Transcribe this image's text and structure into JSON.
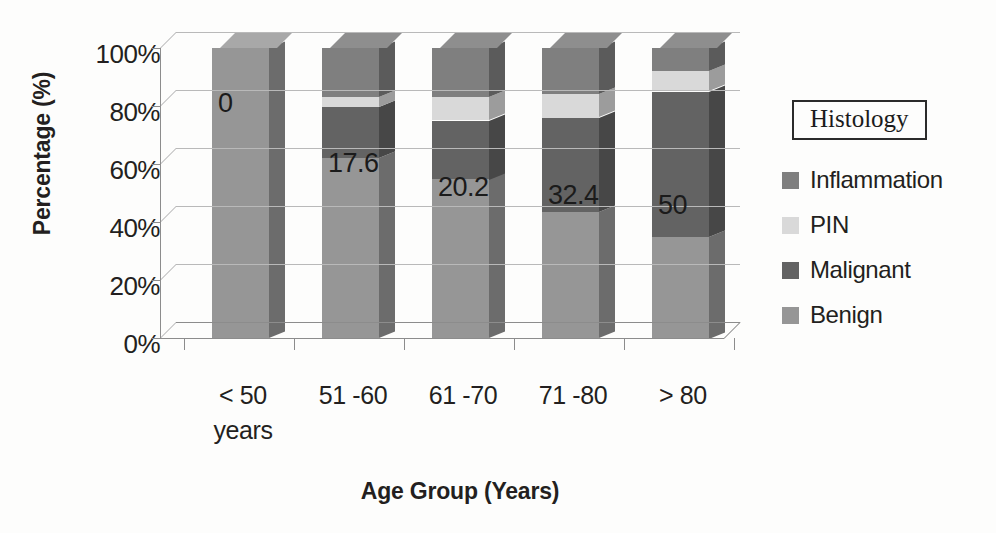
{
  "chart_data": {
    "type": "bar",
    "subtype": "stacked-column-100-3d",
    "title": "",
    "xlabel": "Age Group (Years)",
    "ylabel": "Percentage (%)",
    "ylim": [
      0,
      100
    ],
    "ytick_labels": [
      "0%",
      "20%",
      "40%",
      "60%",
      "80%",
      "100%"
    ],
    "ytick_values": [
      0,
      20,
      40,
      60,
      80,
      100
    ],
    "grid": true,
    "legend_position": "right",
    "legend_title": "Histology",
    "categories": [
      "< 50\nyears",
      "51 -60",
      "61 -70",
      "71 -80",
      "> 80"
    ],
    "categories_flat": [
      "< 50 years",
      "51 -60",
      "61 -70",
      "71 -80",
      "> 80"
    ],
    "series": [
      {
        "name": "Benign",
        "color": "#969696",
        "values": [
          100.0,
          62.0,
          54.8,
          43.6,
          35.0
        ]
      },
      {
        "name": "Malignant",
        "color": "#636363",
        "values": [
          0.0,
          17.6,
          20.2,
          32.4,
          50.0
        ]
      },
      {
        "name": "PIN",
        "color": "#d9d9d9",
        "values": [
          0.0,
          3.4,
          8.0,
          8.0,
          7.0
        ]
      },
      {
        "name": "Inflammation",
        "color": "#7f7f7f",
        "values": [
          0.0,
          17.0,
          17.0,
          16.0,
          8.0
        ]
      }
    ],
    "data_labels": [
      "0",
      "17.6",
      "20.2",
      "32.4",
      "50"
    ],
    "data_labels_series": "Malignant"
  },
  "legend": {
    "title": "Histology",
    "items": [
      {
        "label": "Inflammation",
        "color": "#7f7f7f"
      },
      {
        "label": "PIN",
        "color": "#d9d9d9"
      },
      {
        "label": "Malignant",
        "color": "#636363"
      },
      {
        "label": "Benign",
        "color": "#969696"
      }
    ]
  },
  "axes": {
    "y_title": "Percentage (%)",
    "x_title": "Age Group (Years)",
    "y_ticks": [
      "100%",
      "80%",
      "60%",
      "40%",
      "20%",
      "0%"
    ],
    "x_categories": [
      "< 50\nyears",
      "51 -60",
      "61 -70",
      "71 -80",
      "> 80"
    ]
  }
}
